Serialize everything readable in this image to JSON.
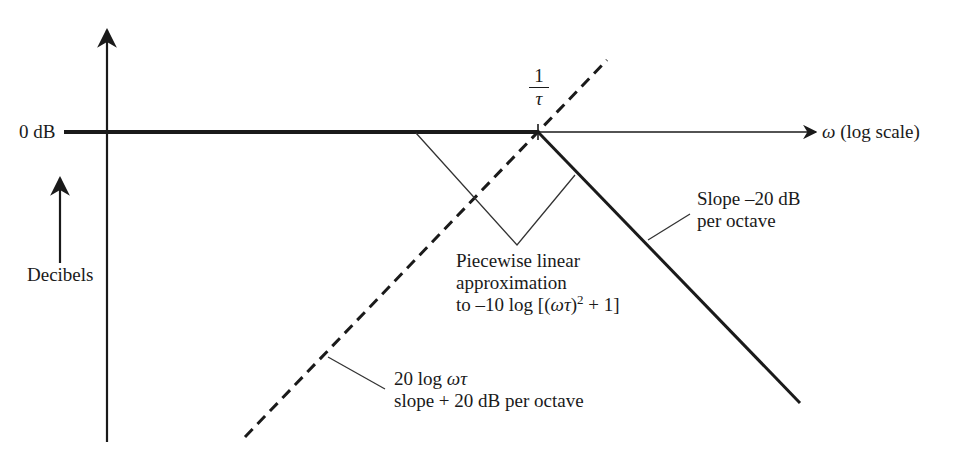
{
  "diagram": {
    "type": "bode_magnitude_asymptote",
    "colors": {
      "ink": "#1a1a1a",
      "background": "#ffffff"
    },
    "axes": {
      "y_axis_label": "Decibels",
      "zero_level_label": "0 dB",
      "x_axis_symbol": "ω",
      "x_axis_label": "(log scale)"
    },
    "corner_frequency": {
      "numerator": "1",
      "denominator": "τ"
    },
    "annotations": {
      "slope_neg": {
        "line1": "Slope –20 dB",
        "line2": "per octave"
      },
      "piecewise": {
        "line1": "Piecewise linear",
        "line2": "approximation",
        "line3_prefix": "to –10 log [(",
        "line3_omega_tau": "ωτ",
        "line3_paren": ")",
        "line3_exp": "2",
        "line3_suffix": " + 1]"
      },
      "log_term": {
        "line1_prefix": "20 log ",
        "line1_symbol": "ωτ",
        "line2": "slope + 20 dB per octave"
      }
    }
  }
}
